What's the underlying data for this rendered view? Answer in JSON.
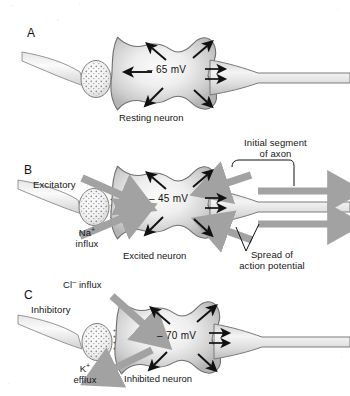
{
  "figure": {
    "background": "#ffffff",
    "colors": {
      "soma_fill_light": "#f2f2f2",
      "soma_fill_dark": "#b9b9b9",
      "outline": "#6e6e6e",
      "gray_arrow": "#a0a0a0",
      "black_arrow": "#111111",
      "text": "#161616"
    }
  },
  "panels": [
    {
      "id": "A",
      "letter": "A",
      "caption": "Resting neuron",
      "voltage": "– 65 mV",
      "labels": [],
      "gray_arrows": [],
      "state": "resting"
    },
    {
      "id": "B",
      "letter": "B",
      "caption": "Excited neuron",
      "voltage": "– 45 mV",
      "labels": [
        {
          "name": "excitatory",
          "text": "Excitatory"
        },
        {
          "name": "na-influx",
          "line1": "Na",
          "sup": "+",
          "line2": "influx"
        },
        {
          "name": "initial-segment",
          "line1": "Initial segment",
          "line2": "of axon"
        },
        {
          "name": "spread",
          "line1": "Spread of",
          "line2": "action potential"
        }
      ],
      "state": "excited"
    },
    {
      "id": "C",
      "letter": "C",
      "caption": "Inhibited neuron",
      "voltage": "– 70 mV",
      "labels": [
        {
          "name": "cl-influx",
          "text": "Cl",
          "sup": "–",
          "rest": " influx"
        },
        {
          "name": "inhibitory",
          "text": "Inhibitory"
        },
        {
          "name": "k-efflux",
          "line1": "K",
          "sup": "+",
          "line2": "efflux"
        }
      ],
      "state": "inhibited"
    }
  ],
  "text": {
    "a_letter": "A",
    "b_letter": "B",
    "c_letter": "C",
    "a_caption": "Resting neuron",
    "b_caption": "Excited neuron",
    "c_caption": "Inhibited neuron",
    "a_voltage": "– 65 mV",
    "b_voltage": "– 45 mV",
    "c_voltage": "– 70 mV",
    "excitatory": "Excitatory",
    "inhibitory": "Inhibitory",
    "na_ion": "Na",
    "na_sup": "+",
    "na_influx": "influx",
    "k_ion": "K",
    "k_sup": "+",
    "k_efflux": "efflux",
    "cl_ion": "Cl",
    "cl_sup": "–",
    "cl_influx": " influx",
    "initial_segment_1": "Initial segment",
    "initial_segment_2": "of axon",
    "spread_1": "Spread of",
    "spread_2": "action potential"
  }
}
